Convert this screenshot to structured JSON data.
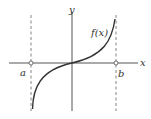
{
  "figure": {
    "axes": {
      "x_label": "x",
      "y_label": "y"
    },
    "curve_label": "f(x)",
    "asymptote_labels": {
      "left": "a",
      "right": "b"
    },
    "colors": {
      "axis": "#555555",
      "curve": "#333333",
      "asymptote": "#777777",
      "text": "#333333"
    }
  }
}
